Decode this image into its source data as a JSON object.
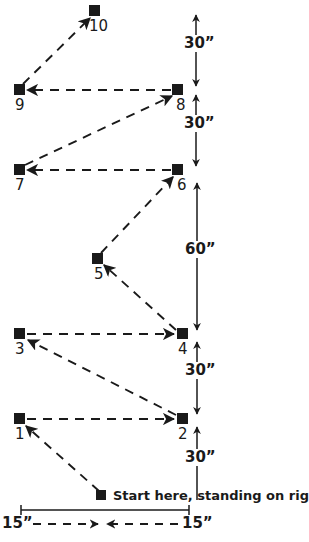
{
  "figure": {
    "type": "diagram",
    "background_color": "#ffffff",
    "ink_color": "#1a1a1a",
    "width": 309,
    "height": 542
  },
  "markers": [
    {
      "id": "start",
      "label": "",
      "x": 102,
      "y": 496
    },
    {
      "id": "1",
      "label": "1",
      "x": 20,
      "y": 419,
      "label_x": 15,
      "label_y": 427
    },
    {
      "id": "2",
      "label": "2",
      "x": 182,
      "y": 419,
      "label_x": 178,
      "label_y": 427
    },
    {
      "id": "3",
      "label": "3",
      "x": 20,
      "y": 334,
      "label_x": 15,
      "label_y": 342
    },
    {
      "id": "4",
      "label": "4",
      "x": 182,
      "y": 334,
      "label_x": 178,
      "label_y": 342
    },
    {
      "id": "5",
      "label": "5",
      "x": 98,
      "y": 259,
      "label_x": 94,
      "label_y": 267
    },
    {
      "id": "6",
      "label": "6",
      "x": 178,
      "y": 170,
      "label_x": 177,
      "label_y": 178
    },
    {
      "id": "7",
      "label": "7",
      "x": 20,
      "y": 170,
      "label_x": 15,
      "label_y": 178
    },
    {
      "id": "8",
      "label": "8",
      "x": 178,
      "y": 90,
      "label_x": 176,
      "label_y": 98
    },
    {
      "id": "9",
      "label": "9",
      "x": 20,
      "y": 90,
      "label_x": 15,
      "label_y": 98
    },
    {
      "id": "10",
      "label": "10",
      "x": 95,
      "y": 11,
      "label_x": 89,
      "label_y": 19
    }
  ],
  "path_steps": [
    {
      "from": "start",
      "to": "1"
    },
    {
      "from": "1",
      "to": "2"
    },
    {
      "from": "2",
      "to": "3"
    },
    {
      "from": "3",
      "to": "4"
    },
    {
      "from": "4",
      "to": "5"
    },
    {
      "from": "5",
      "to": "6"
    },
    {
      "from": "6",
      "to": "7"
    },
    {
      "from": "7",
      "to": "8"
    },
    {
      "from": "8",
      "to": "9"
    },
    {
      "from": "9",
      "to": "10"
    }
  ],
  "vertical_dimensions": [
    {
      "id": "dim-30-top",
      "value": "30”",
      "from_marker": "8",
      "to_marker": "10-row",
      "label_x": 183,
      "label_y": 42
    },
    {
      "id": "dim-30-second",
      "value": "30”",
      "from_marker": "6",
      "to_marker": "8",
      "label_x": 183,
      "label_y": 122
    },
    {
      "id": "dim-60",
      "value": "60”",
      "from_marker": "4",
      "to_marker": "6",
      "label_x": 183,
      "label_y": 248
    },
    {
      "id": "dim-30-third",
      "value": "30”",
      "from_marker": "2",
      "to_marker": "4",
      "label_x": 183,
      "label_y": 369
    },
    {
      "id": "dim-30-bottom",
      "value": "30”",
      "from_marker": "start-row",
      "to_marker": "2",
      "label_x": 183,
      "label_y": 456
    }
  ],
  "horizontal_dimensions": [
    {
      "id": "dim-15-left",
      "value": "15”",
      "label_x": 2,
      "label_y": 515
    },
    {
      "id": "dim-15-right",
      "value": "15”",
      "label_x": 183,
      "label_y": 515
    }
  ],
  "caption": {
    "start_text": "Start here, standing on right foot.",
    "start_text_x": 113,
    "start_text_y": 490
  },
  "icons": {
    "marker": "filled-square-marker",
    "arrow": "dashed-arrow",
    "dimension": "double-headed-arrow"
  }
}
